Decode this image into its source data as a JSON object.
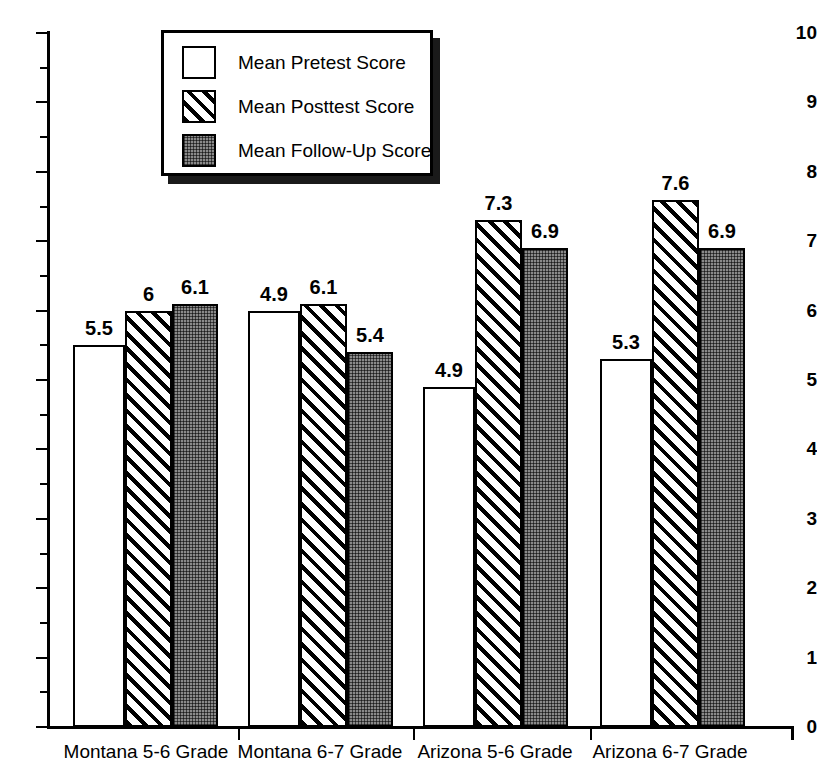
{
  "chart_data": {
    "type": "bar",
    "title": "",
    "xlabel": "",
    "ylabel": "",
    "ylim": [
      0,
      10
    ],
    "ytick_step": 1,
    "yminor_step": 0.5,
    "grid": false,
    "legend_position": "top-center-left",
    "categories": [
      "Montana 5-6 Grade",
      "Montana 6-7 Grade",
      "Arizona 5-6 Grade",
      "Arizona 6-7 Grade"
    ],
    "ytick_labels": [
      "0",
      "1",
      "2",
      "3",
      "4",
      "5",
      "6",
      "7",
      "8",
      "9",
      "10"
    ],
    "series": [
      {
        "name": "Mean Pretest Score",
        "pattern": "solid-white",
        "values": [
          5.5,
          6.0,
          4.9,
          5.3
        ],
        "value_labels": [
          "5.5",
          "4.9",
          "4.9",
          "5.3"
        ]
      },
      {
        "name": "Mean Posttest Score",
        "pattern": "diagonal-hatch",
        "values": [
          6.0,
          6.1,
          7.3,
          7.6
        ],
        "value_labels": [
          "6",
          "6.1",
          "7.3",
          "7.6"
        ]
      },
      {
        "name": "Mean Follow-Up Score",
        "pattern": "dark-stipple",
        "values": [
          6.1,
          5.4,
          6.9,
          6.9
        ],
        "value_labels": [
          "6.1",
          "5.4",
          "6.9",
          "6.9"
        ]
      }
    ],
    "bars": [
      {
        "category": "Montana 5-6 Grade",
        "series": "Mean Pretest Score",
        "value": 5.5,
        "label": "5.5"
      },
      {
        "category": "Montana 5-6 Grade",
        "series": "Mean Posttest Score",
        "value": 6.0,
        "label": "6"
      },
      {
        "category": "Montana 5-6 Grade",
        "series": "Mean Follow-Up Score",
        "value": 6.1,
        "label": "6.1"
      },
      {
        "category": "Montana 6-7 Grade",
        "series": "Mean Pretest Score",
        "value": 4.9,
        "label": "4.9"
      },
      {
        "category": "Montana 6-7 Grade",
        "series": "Mean Posttest Score",
        "value": 6.1,
        "label": "6.1"
      },
      {
        "category": "Montana 6-7 Grade",
        "series": "Mean Follow-Up Score",
        "value": 5.4,
        "label": "5.4"
      },
      {
        "category": "Arizona 5-6 Grade",
        "series": "Mean Pretest Score",
        "value": 4.9,
        "label": "4.9"
      },
      {
        "category": "Arizona 5-6 Grade",
        "series": "Mean Posttest Score",
        "value": 7.3,
        "label": "7.3"
      },
      {
        "category": "Arizona 5-6 Grade",
        "series": "Mean Follow-Up Score",
        "value": 6.9,
        "label": "6.9"
      },
      {
        "category": "Arizona 6-7 Grade",
        "series": "Mean Pretest Score",
        "value": 5.3,
        "label": "5.3"
      },
      {
        "category": "Arizona 6-7 Grade",
        "series": "Mean Posttest Score",
        "value": 7.6,
        "label": "7.6"
      },
      {
        "category": "Arizona 6-7 Grade",
        "series": "Mean Follow-Up Score",
        "value": 6.9,
        "label": "6.9"
      }
    ],
    "colors": {
      "axis": "#000000",
      "bar_outline": "#000000",
      "pretest_fill": "#ffffff",
      "posttest_fill": "#ffffff",
      "posttest_hatch": "#000000",
      "followup_fill": "#8a8a8a",
      "legend_shadow": "#1a1a1a",
      "background": "#ffffff"
    }
  },
  "legend": {
    "items": [
      {
        "label": "Mean Pretest Score",
        "pattern": "solid-white"
      },
      {
        "label": "Mean Posttest Score",
        "pattern": "diagonal-hatch"
      },
      {
        "label": "Mean Follow-Up Score",
        "pattern": "dark-stipple"
      }
    ]
  }
}
